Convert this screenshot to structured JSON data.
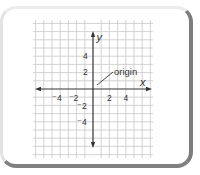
{
  "figure": {
    "axis_labels": {
      "x": "x",
      "y": "y"
    },
    "annotation": "origin",
    "x_ticks": [
      {
        "value": -4,
        "label": "⁻4"
      },
      {
        "value": -2,
        "label": "⁻2"
      },
      {
        "value": 2,
        "label": "2"
      },
      {
        "value": 4,
        "label": "4"
      }
    ],
    "y_ticks": [
      {
        "value": 4,
        "label": "4"
      },
      {
        "value": 2,
        "label": "2"
      },
      {
        "value": -2,
        "label": "⁻2"
      },
      {
        "value": -4,
        "label": "⁻4"
      }
    ],
    "colors": {
      "grid": "#c8c8c8",
      "axes": "#333333",
      "frame_shadow": "#7d7d7d"
    }
  }
}
